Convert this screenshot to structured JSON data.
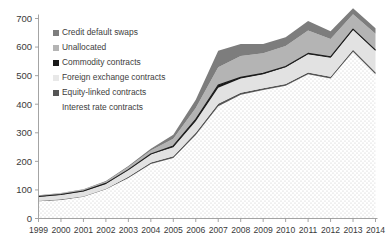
{
  "chart_data": {
    "type": "area",
    "stacked": true,
    "title": "",
    "xlabel": "",
    "ylabel": "",
    "categories": [
      "1999",
      "2000",
      "2001",
      "2002",
      "2003",
      "2004",
      "2005",
      "2006",
      "2007",
      "2008",
      "2009",
      "2010",
      "2011",
      "2012",
      "2013",
      "2014"
    ],
    "x": [
      1999,
      2000,
      2001,
      2002,
      2003,
      2004,
      2005,
      2006,
      2007,
      2008,
      2009,
      2010,
      2011,
      2012,
      2013,
      2014
    ],
    "ylim": [
      0,
      700
    ],
    "yticks": [
      0,
      100,
      200,
      300,
      400,
      500,
      600,
      700
    ],
    "ytick_labels": [
      "0",
      "100",
      "200",
      "300",
      "400",
      "500",
      "600",
      "700"
    ],
    "xlim": [
      1999,
      2014
    ],
    "grid": false,
    "legend_position": "inside-top-left",
    "series": [
      {
        "name": "Interest rate contracts",
        "color": "#fbfbfb",
        "pattern": "dotted",
        "values": [
          60,
          65,
          76,
          102,
          142,
          191,
          212,
          292,
          393,
          433,
          450,
          465,
          505,
          490,
          584,
          505
        ]
      },
      {
        "name": "Equity-linked contracts",
        "color": "#555555",
        "pattern": "solid",
        "values": [
          2,
          2,
          2,
          2,
          4,
          5,
          6,
          8,
          9,
          7,
          6,
          6,
          6,
          6,
          7,
          7
        ]
      },
      {
        "name": "Foreign exchange contracts",
        "color": "#e2e2e2",
        "pattern": "solid",
        "values": [
          14,
          16,
          17,
          18,
          24,
          29,
          31,
          40,
          56,
          50,
          49,
          58,
          64,
          67,
          70,
          75
        ]
      },
      {
        "name": "Commodity contracts",
        "color": "#1a1a1a",
        "pattern": "solid",
        "values": [
          1,
          1,
          1,
          1,
          1,
          1,
          5,
          7,
          9,
          4,
          3,
          3,
          3,
          3,
          2,
          2
        ]
      },
      {
        "name": "Unallocated",
        "color": "#b4b4b4",
        "pattern": "solid",
        "values": [
          3,
          4,
          5,
          6,
          9,
          12,
          25,
          40,
          62,
          75,
          70,
          72,
          80,
          62,
          52,
          58
        ]
      },
      {
        "name": "Credit default swaps",
        "color": "#7d7d7d",
        "pattern": "solid",
        "values": [
          1,
          1,
          1,
          2,
          4,
          6,
          14,
          29,
          58,
          42,
          33,
          30,
          33,
          27,
          21,
          19
        ]
      }
    ],
    "legend_entries": [
      {
        "label": "Credit default swaps",
        "color": "#7d7d7d",
        "marker": "square"
      },
      {
        "label": "Unallocated",
        "color": "#b4b4b4",
        "marker": "square"
      },
      {
        "label": "Commodity contracts",
        "color": "#1a1a1a",
        "marker": "square"
      },
      {
        "label": "Foreign exchange contracts",
        "color": "#e8e8e8",
        "marker": "square"
      },
      {
        "label": "Equity-linked contracts",
        "color": "#555555",
        "marker": "square"
      },
      {
        "label": "Interest rate contracts",
        "color": "#ffffff",
        "marker": "none"
      }
    ],
    "axis_color": "#9a9a9a",
    "outline_color": "#1a1a1a"
  }
}
